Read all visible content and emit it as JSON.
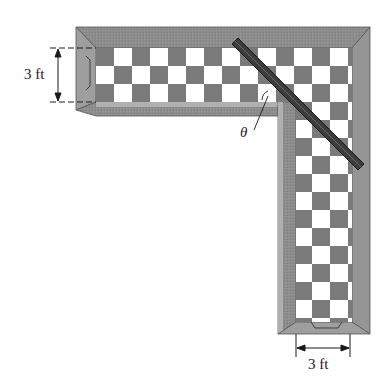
{
  "figure": {
    "labels": {
      "left_width": "3 ft",
      "bottom_width": "3 ft",
      "angle": "θ"
    },
    "colors": {
      "wall_outer": "#8c8c8c",
      "wall_top": "#a6a6a6",
      "wall_shadow": "#6e6e6e",
      "floor_dark": "#7a7a7a",
      "floor_light": "#ffffff",
      "ladder": "#3c3c3c",
      "ladder_edge": "#1a1a1a",
      "line": "#1a1a1a"
    },
    "geometry": {
      "cell_size": 18,
      "horizontal_hall": {
        "floor_x0": 96,
        "floor_x1": 352,
        "floor_y0": 48,
        "floor_y1": 102
      },
      "vertical_hall": {
        "floor_x0": 296,
        "floor_x1": 352,
        "floor_y0": 48,
        "floor_y1": 322
      },
      "ladder": {
        "x1": 236,
        "y1": 40,
        "x2": 360,
        "y2": 168
      }
    }
  }
}
